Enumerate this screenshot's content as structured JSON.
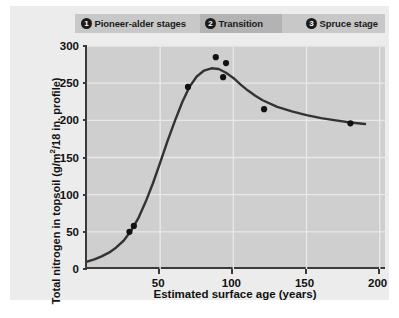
{
  "chart_data": {
    "type": "line",
    "title": "",
    "xlabel": "Estimated surface age (years)",
    "ylabel_text": "Total nitrogen in topsoil (g/m",
    "ylabel_sup": "2",
    "ylabel_tail": "/18 in. profile)",
    "ylabel": "Total nitrogen in topsoil (g/m2/18 in. profile)",
    "xlim": [
      0,
      205
    ],
    "ylim": [
      0,
      300
    ],
    "xticks": [
      50,
      100,
      150,
      200
    ],
    "yticks": [
      0,
      50,
      100,
      150,
      200,
      250,
      300
    ],
    "xtick_labels": [
      "50",
      "100",
      "150",
      "200"
    ],
    "ytick_labels": [
      "0",
      "50",
      "100",
      "150",
      "200",
      "250",
      "300"
    ],
    "grid": true,
    "legend": "none",
    "series": [
      {
        "name": "Fitted curve",
        "type": "line",
        "color": "#333333",
        "x": [
          0,
          5,
          10,
          15,
          20,
          25,
          30,
          35,
          40,
          45,
          50,
          55,
          60,
          65,
          70,
          75,
          80,
          85,
          90,
          95,
          100,
          105,
          110,
          115,
          120,
          130,
          140,
          150,
          160,
          170,
          180,
          190
        ],
        "y": [
          10,
          13,
          17,
          22,
          29,
          38,
          51,
          68,
          90,
          115,
          143,
          172,
          199,
          224,
          245,
          259,
          267,
          270,
          269,
          264,
          257,
          248,
          240,
          233,
          227,
          218,
          212,
          207,
          203,
          200,
          197,
          195
        ]
      },
      {
        "name": "Observed plots",
        "type": "scatter",
        "color": "#111111",
        "points": [
          {
            "x": 29,
            "y": 50
          },
          {
            "x": 32,
            "y": 58
          },
          {
            "x": 69,
            "y": 245
          },
          {
            "x": 88,
            "y": 285
          },
          {
            "x": 95,
            "y": 277
          },
          {
            "x": 93,
            "y": 258
          },
          {
            "x": 121,
            "y": 215
          },
          {
            "x": 180,
            "y": 196
          }
        ]
      }
    ]
  },
  "banner": {
    "segments": [
      {
        "number": "1",
        "label": "Pioneer-alder stages",
        "color": "#c8c8c8"
      },
      {
        "number": "2",
        "label": "Transition",
        "color": "#b3b3b3"
      },
      {
        "number": "3",
        "label": "Spruce stage",
        "color": "#c8c8c8"
      }
    ]
  },
  "colors": {
    "panel_background": "#ececec",
    "plot_background": "#cfcfcf",
    "gridline": "#e8e8e8",
    "axis": "#3a3a3a",
    "curve": "#333333",
    "marker": "#111111"
  }
}
